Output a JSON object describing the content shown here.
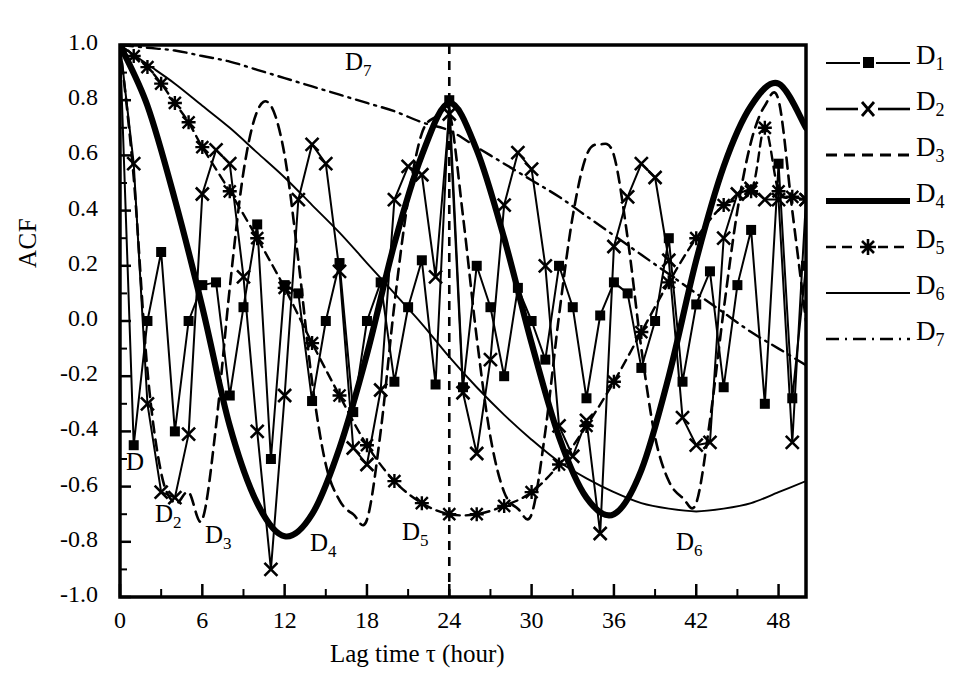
{
  "axes": {
    "ylabel": "ACF",
    "xlabel": "Lag time τ (hour)",
    "yticks": [
      "1.0",
      "0.8",
      "0.6",
      "0.4",
      "0.2",
      "0.0",
      "-0.2",
      "-0.4",
      "-0.6",
      "-0.8",
      "-1.0"
    ],
    "xticks": [
      "0",
      "6",
      "12",
      "18",
      "24",
      "30",
      "36",
      "42",
      "48"
    ]
  },
  "legend": {
    "items": [
      {
        "label": "D",
        "sub": "1",
        "style": "line-square"
      },
      {
        "label": "D",
        "sub": "2",
        "style": "line-cross"
      },
      {
        "label": "D",
        "sub": "3",
        "style": "dashed"
      },
      {
        "label": "D",
        "sub": "4",
        "style": "thick-solid"
      },
      {
        "label": "D",
        "sub": "5",
        "style": "dashed-star"
      },
      {
        "label": "D",
        "sub": "6",
        "style": "thin-solid"
      },
      {
        "label": "D",
        "sub": "7",
        "style": "dash-dot"
      }
    ]
  },
  "annotations": [
    {
      "name": "curve-label-d1",
      "text": "D",
      "sub": "",
      "x": 126,
      "y": 448
    },
    {
      "name": "curve-label-d2",
      "text": "D",
      "sub": "2",
      "x": 155,
      "y": 500
    },
    {
      "name": "curve-label-d3",
      "text": "D",
      "sub": "3",
      "x": 205,
      "y": 521
    },
    {
      "name": "curve-label-d4",
      "text": "D",
      "sub": "4",
      "x": 310,
      "y": 529
    },
    {
      "name": "curve-label-d5",
      "text": "D",
      "sub": "5",
      "x": 402,
      "y": 518
    },
    {
      "name": "curve-label-d6",
      "text": "D",
      "sub": "6",
      "x": 676,
      "y": 528
    },
    {
      "name": "curve-label-d7",
      "text": "D",
      "sub": "7",
      "x": 345,
      "y": 48
    }
  ],
  "chart_data": {
    "type": "line",
    "title": "",
    "xlabel": "Lag time τ (hour)",
    "ylabel": "ACF",
    "xlim": [
      0,
      50
    ],
    "ylim": [
      -1.0,
      1.0
    ],
    "grid": false,
    "legend_position": "right",
    "reference_line": {
      "orientation": "vertical",
      "x": 24,
      "style": "dashed"
    },
    "series": [
      {
        "name": "D1",
        "style": "solid-thin",
        "marker": "square",
        "period": 3,
        "x": [
          0,
          1,
          2,
          3,
          4,
          5,
          6,
          7,
          8,
          9,
          10,
          11,
          12,
          13,
          14,
          15,
          16,
          17,
          18,
          19,
          20,
          21,
          22,
          23,
          24,
          25,
          26,
          27,
          28,
          29,
          30,
          31,
          32,
          33,
          34,
          35,
          36,
          37,
          38,
          39,
          40,
          41,
          42,
          43,
          44,
          45,
          46,
          47,
          48,
          49,
          50
        ],
        "y": [
          1.0,
          -0.45,
          0.0,
          0.25,
          -0.4,
          0.0,
          0.13,
          0.14,
          -0.27,
          0.05,
          0.35,
          -0.5,
          0.13,
          0.1,
          -0.29,
          0.0,
          0.21,
          -0.33,
          0.0,
          0.14,
          -0.22,
          0.05,
          0.22,
          -0.23,
          0.8,
          -0.24,
          0.2,
          0.05,
          -0.2,
          0.12,
          0.0,
          -0.14,
          0.2,
          0.05,
          -0.28,
          0.02,
          0.14,
          0.1,
          -0.17,
          0.0,
          0.3,
          -0.22,
          0.06,
          0.18,
          -0.24,
          0.13,
          0.33,
          -0.3,
          0.57,
          -0.28,
          0.2
        ]
      },
      {
        "name": "D2",
        "style": "solid-thin",
        "marker": "cross",
        "period": 6,
        "x": [
          0,
          1,
          2,
          3,
          4,
          5,
          6,
          7,
          8,
          9,
          10,
          11,
          12,
          13,
          14,
          15,
          16,
          17,
          18,
          19,
          20,
          21,
          22,
          23,
          24,
          25,
          26,
          27,
          28,
          29,
          30,
          31,
          32,
          33,
          34,
          35,
          36,
          37,
          38,
          39,
          40,
          41,
          42,
          43,
          44,
          45,
          46,
          47,
          48,
          49,
          50
        ],
        "y": [
          1.0,
          0.57,
          -0.3,
          -0.62,
          -0.64,
          -0.41,
          0.46,
          0.62,
          0.57,
          0.16,
          -0.4,
          -0.9,
          -0.27,
          0.44,
          0.64,
          0.57,
          0.18,
          -0.46,
          -0.52,
          -0.25,
          0.44,
          0.56,
          0.53,
          0.16,
          0.75,
          -0.26,
          -0.48,
          -0.14,
          0.42,
          0.61,
          0.55,
          0.2,
          -0.38,
          -0.49,
          -0.36,
          -0.77,
          0.27,
          0.45,
          0.57,
          0.52,
          0.22,
          -0.35,
          -0.45,
          -0.44,
          0.3,
          0.46,
          0.48,
          0.44,
          0.44,
          -0.44,
          0.44
        ]
      },
      {
        "name": "D3",
        "style": "dashed",
        "marker": "none",
        "period": 12,
        "x": [
          0,
          1,
          2,
          3,
          4,
          5,
          6,
          7,
          8,
          9,
          10,
          11,
          12,
          13,
          14,
          15,
          16,
          17,
          18,
          19,
          20,
          21,
          22,
          23,
          24,
          25,
          26,
          27,
          28,
          29,
          30,
          31,
          32,
          33,
          34,
          35,
          36,
          37,
          38,
          39,
          40,
          41,
          42,
          43,
          44,
          45,
          46,
          47,
          48,
          49,
          50
        ],
        "y": [
          1.0,
          0.52,
          -0.18,
          -0.55,
          -0.66,
          -0.62,
          -0.72,
          -0.38,
          0.12,
          0.54,
          0.76,
          0.78,
          0.6,
          0.22,
          -0.22,
          -0.52,
          -0.65,
          -0.7,
          -0.72,
          -0.4,
          0.06,
          0.44,
          0.68,
          0.74,
          0.76,
          0.38,
          -0.06,
          -0.42,
          -0.62,
          -0.68,
          -0.7,
          -0.4,
          0.02,
          0.38,
          0.6,
          0.64,
          0.6,
          0.3,
          -0.1,
          -0.42,
          -0.58,
          -0.64,
          -0.66,
          -0.36,
          0.04,
          0.4,
          0.65,
          0.78,
          0.8,
          0.4,
          0.0
        ]
      },
      {
        "name": "D4",
        "style": "thick-solid",
        "marker": "none",
        "period": 24,
        "x": [
          0,
          2,
          4,
          6,
          8,
          10,
          12,
          14,
          16,
          18,
          20,
          22,
          24,
          26,
          28,
          30,
          32,
          34,
          36,
          38,
          40,
          42,
          44,
          46,
          48,
          50
        ],
        "y": [
          1.0,
          0.78,
          0.44,
          0.05,
          -0.38,
          -0.66,
          -0.78,
          -0.7,
          -0.46,
          -0.12,
          0.28,
          0.6,
          0.79,
          0.62,
          0.3,
          -0.08,
          -0.42,
          -0.64,
          -0.7,
          -0.54,
          -0.2,
          0.22,
          0.56,
          0.78,
          0.86,
          0.7
        ]
      },
      {
        "name": "D5",
        "style": "dashed-star",
        "marker": "star",
        "period": 48,
        "x": [
          0,
          1,
          2,
          3,
          4,
          5,
          6,
          8,
          10,
          12,
          14,
          16,
          18,
          20,
          22,
          24,
          26,
          28,
          30,
          32,
          34,
          36,
          38,
          40,
          42,
          44,
          46,
          47,
          48,
          49,
          50
        ],
        "y": [
          1.0,
          0.96,
          0.92,
          0.86,
          0.79,
          0.72,
          0.63,
          0.47,
          0.3,
          0.12,
          -0.08,
          -0.27,
          -0.45,
          -0.58,
          -0.66,
          -0.7,
          -0.7,
          -0.67,
          -0.62,
          -0.52,
          -0.38,
          -0.22,
          -0.04,
          0.14,
          0.3,
          0.42,
          0.47,
          0.7,
          0.47,
          0.45,
          0.44
        ]
      },
      {
        "name": "D6",
        "style": "thin-solid",
        "marker": "none",
        "x": [
          0,
          2,
          4,
          6,
          8,
          10,
          12,
          14,
          16,
          18,
          20,
          22,
          24,
          26,
          28,
          30,
          32,
          34,
          36,
          38,
          40,
          42,
          44,
          46,
          48,
          50
        ],
        "y": [
          1.0,
          0.93,
          0.86,
          0.78,
          0.7,
          0.61,
          0.52,
          0.42,
          0.32,
          0.21,
          0.1,
          -0.01,
          -0.13,
          -0.24,
          -0.34,
          -0.43,
          -0.51,
          -0.57,
          -0.62,
          -0.66,
          -0.68,
          -0.69,
          -0.68,
          -0.66,
          -0.62,
          -0.58
        ]
      },
      {
        "name": "D7",
        "style": "dash-dot",
        "marker": "none",
        "x": [
          0,
          2,
          4,
          6,
          8,
          10,
          12,
          14,
          16,
          18,
          20,
          22,
          24,
          26,
          28,
          30,
          32,
          34,
          36,
          38,
          40,
          42,
          44,
          46,
          48,
          50
        ],
        "y": [
          1.0,
          0.99,
          0.98,
          0.96,
          0.94,
          0.91,
          0.88,
          0.85,
          0.82,
          0.79,
          0.76,
          0.72,
          0.69,
          0.63,
          0.57,
          0.51,
          0.45,
          0.38,
          0.31,
          0.24,
          0.17,
          0.1,
          0.03,
          -0.04,
          -0.1,
          -0.16
        ]
      }
    ]
  }
}
